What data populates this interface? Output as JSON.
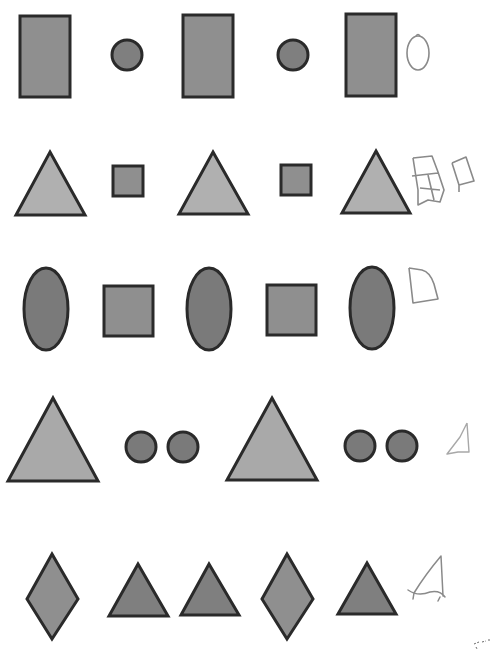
{
  "worksheet": {
    "type": "shape-pattern-completion",
    "colors": {
      "outline": "#2a2a2a",
      "fill_light": "#a9a9a9",
      "fill_mid": "#8f8f8f",
      "fill_dark": "#7a7a7a",
      "pencil": "#8a8a8a",
      "background": "#ffffff"
    },
    "rows": [
      {
        "index": 1,
        "pattern": [
          "rectangle",
          "circle",
          "rectangle",
          "circle",
          "rectangle"
        ],
        "answer_sketch": "oval"
      },
      {
        "index": 2,
        "pattern": [
          "triangle",
          "square",
          "triangle",
          "square",
          "triangle"
        ],
        "answer_sketch": "squares"
      },
      {
        "index": 3,
        "pattern": [
          "oval",
          "square",
          "oval",
          "square",
          "oval"
        ],
        "answer_sketch": "square"
      },
      {
        "index": 4,
        "pattern": [
          "triangle",
          "circle",
          "circle",
          "triangle",
          "circle",
          "circle"
        ],
        "answer_sketch": "triangle"
      },
      {
        "index": 5,
        "pattern": [
          "diamond",
          "triangle",
          "triangle",
          "diamond",
          "triangle"
        ],
        "answer_sketch": "triangle"
      }
    ]
  }
}
